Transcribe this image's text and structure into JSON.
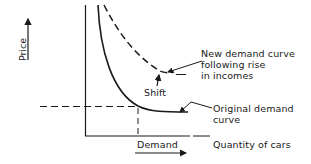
{
  "diagram": {
    "type": "economics-demand-shift",
    "y_axis_label": "Price",
    "x_axis_label": "Quantity of cars",
    "x_marker_label": "Demand",
    "annotations": {
      "new_curve": [
        "New demand curve",
        "following rise",
        "in incomes"
      ],
      "original_curve": [
        "Original demand",
        "curve"
      ],
      "shift": "Shift"
    },
    "curves": [
      {
        "name": "Original demand curve",
        "style": "solid"
      },
      {
        "name": "New demand curve following rise in incomes",
        "style": "dashed"
      }
    ],
    "colors": {
      "line": "#1a1a1a",
      "background": "#ffffff"
    }
  }
}
